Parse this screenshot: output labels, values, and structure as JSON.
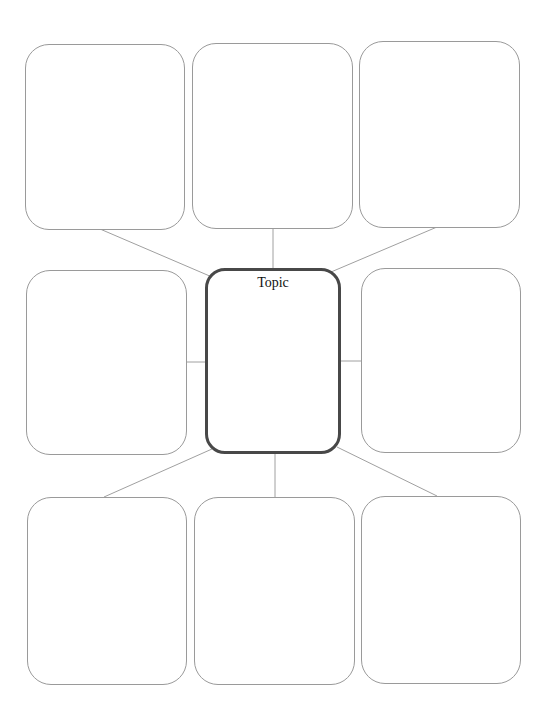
{
  "diagram": {
    "type": "concept-map",
    "center": {
      "label": "Topic"
    },
    "boxes": [
      {
        "id": "top-left",
        "label": ""
      },
      {
        "id": "top-middle",
        "label": ""
      },
      {
        "id": "top-right",
        "label": ""
      },
      {
        "id": "middle-left",
        "label": ""
      },
      {
        "id": "middle-right",
        "label": ""
      },
      {
        "id": "bottom-left",
        "label": ""
      },
      {
        "id": "bottom-middle",
        "label": ""
      },
      {
        "id": "bottom-right",
        "label": ""
      }
    ],
    "colors": {
      "box_border": "#9a9a9a",
      "center_border": "#484848",
      "connector": "#9a9a9a",
      "background": "#ffffff"
    }
  }
}
